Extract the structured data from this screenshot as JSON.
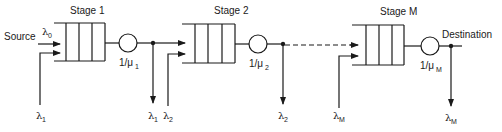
{
  "diagram": {
    "type": "tandem-queue-network",
    "source_label": "Source",
    "destination_label": "Destination",
    "stages": [
      {
        "title": "Stage 1",
        "service_rate_label": "1/μ",
        "service_rate_sub": "1",
        "input_arrival_sym": "λ",
        "input_arrival_sub": "0",
        "external_arrival_sym": "λ",
        "external_arrival_sub": "1",
        "departure_sym": "λ",
        "departure_sub": "1"
      },
      {
        "title": "Stage 2",
        "service_rate_label": "1/μ",
        "service_rate_sub": "2",
        "external_arrival_sym": "λ",
        "external_arrival_sub": "2",
        "departure_sym": "λ",
        "departure_sub": "2"
      },
      {
        "title": "Stage M",
        "service_rate_label": "1/μ",
        "service_rate_sub": "M",
        "external_arrival_sym": "λ",
        "external_arrival_sub": "M",
        "departure_sym": "λ",
        "departure_sub": "M"
      }
    ]
  }
}
